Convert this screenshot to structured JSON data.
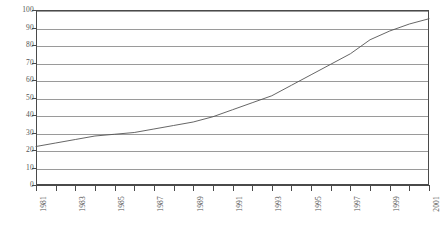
{
  "chart_data": {
    "type": "line",
    "title": "",
    "subtitle": "",
    "xlabel": "",
    "ylabel": "",
    "grid": "horizontal",
    "legend": "none",
    "xlim": [
      1981,
      2001
    ],
    "ylim": [
      0,
      100
    ],
    "ytick_step": 10,
    "ytick_labels": [
      "100",
      "90",
      "80",
      "70",
      "60",
      "50",
      "40",
      "30",
      "20",
      "10",
      "0"
    ],
    "ytick_values": [
      100,
      90,
      80,
      70,
      60,
      50,
      40,
      30,
      20,
      10,
      0
    ],
    "categories": [
      "1981",
      "1982",
      "1983",
      "1984",
      "1985",
      "1986",
      "1987",
      "1988",
      "1989",
      "1990",
      "1991",
      "1992",
      "1993",
      "1994",
      "1995",
      "1996",
      "1997",
      "1998",
      "1999",
      "2000",
      "2001"
    ],
    "xtick_labels_shown": [
      "1981",
      "",
      "1983",
      "",
      "1985",
      "",
      "1987",
      "",
      "1989",
      "",
      "1991",
      "",
      "1993",
      "",
      "1995",
      "",
      "1997",
      "",
      "1999",
      "",
      "2001"
    ],
    "series": [
      {
        "name": "",
        "color": "#555555",
        "values": [
          22,
          24,
          26,
          28,
          29,
          30,
          32,
          34,
          36,
          39,
          43,
          47,
          51,
          57,
          63,
          69,
          75,
          83,
          88,
          92,
          95
        ]
      }
    ]
  },
  "colors": {
    "axis": "#4a4a4a",
    "grid": "#9a9a9a",
    "line": "#555555",
    "text": "#555555",
    "background": "#ffffff"
  }
}
